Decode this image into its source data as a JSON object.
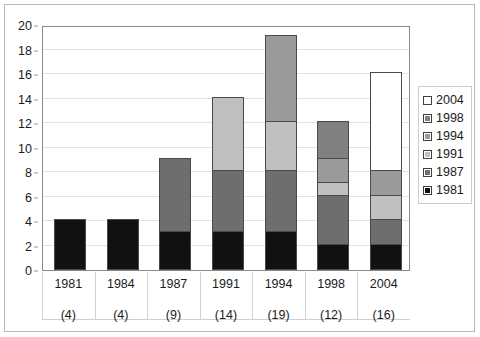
{
  "chart_data": {
    "type": "bar",
    "title": "",
    "subtitle": "",
    "xlabel": "",
    "ylabel": "",
    "ylim": [
      0,
      20
    ],
    "ytick_step": 2,
    "yticks": [
      0,
      2,
      4,
      6,
      8,
      10,
      12,
      14,
      16,
      18,
      20
    ],
    "grid": true,
    "stacked": true,
    "legend_position": "right",
    "categories": [
      "1981",
      "1984",
      "1987",
      "1991",
      "1994",
      "1998",
      "2004"
    ],
    "category_totals": [
      4,
      4,
      9,
      14,
      19,
      12,
      16
    ],
    "category_total_labels": [
      "(4)",
      "(4)",
      "(9)",
      "(14)",
      "(19)",
      "(12)",
      "(16)"
    ],
    "series": [
      {
        "name": "1981",
        "color": "#111111",
        "values": [
          4,
          4,
          3,
          3,
          3,
          2,
          2
        ]
      },
      {
        "name": "1987",
        "color": "#6e6e6e",
        "values": [
          0,
          0,
          6,
          5,
          5,
          4,
          2
        ]
      },
      {
        "name": "1991",
        "color": "#c0c0c0",
        "values": [
          0,
          0,
          0,
          6,
          4,
          1,
          2
        ]
      },
      {
        "name": "1994",
        "color": "#9a9a9a",
        "values": [
          0,
          0,
          0,
          0,
          7,
          2,
          2
        ]
      },
      {
        "name": "1998",
        "color": "#808080",
        "values": [
          0,
          0,
          0,
          0,
          0,
          3,
          0
        ]
      },
      {
        "name": "2004",
        "color": "#ffffff",
        "values": [
          0,
          0,
          0,
          0,
          0,
          0,
          8
        ]
      }
    ],
    "legend_entries": [
      {
        "label": "2004",
        "color": "#ffffff"
      },
      {
        "label": "1998",
        "color": "#808080"
      },
      {
        "label": "1994",
        "color": "#9a9a9a"
      },
      {
        "label": "1991",
        "color": "#c0c0c0"
      },
      {
        "label": "1987",
        "color": "#6e6e6e"
      },
      {
        "label": "1981",
        "color": "#111111"
      }
    ]
  }
}
